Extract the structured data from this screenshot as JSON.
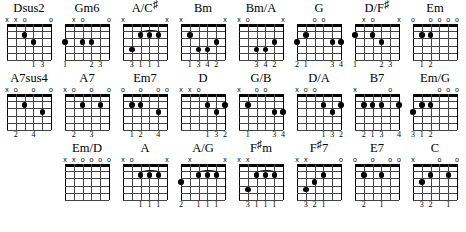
{
  "legend": {
    "open_symbol": "o",
    "muted_symbol": "x"
  },
  "geometry": {
    "strings": 6,
    "frets": 5
  },
  "rows": [
    {
      "chords": [
        {
          "name": "Dsus2",
          "name_base": "Dsus2",
          "sharp": "",
          "markers": [
            "x",
            "x",
            "o",
            "",
            "",
            "o"
          ],
          "dots": [
            {
              "string": 4,
              "fret": 2
            },
            {
              "string": 3,
              "fret": 3
            }
          ],
          "barre": null,
          "fingers": [
            "",
            "",
            "",
            "1",
            "3",
            ""
          ]
        },
        {
          "name": "Gm6",
          "name_base": "Gm6",
          "sharp": "",
          "markers": [
            "",
            "x",
            "o",
            "",
            "",
            "o"
          ],
          "dots": [
            {
              "string": 6,
              "fret": 3
            },
            {
              "string": 4,
              "fret": 3
            },
            {
              "string": 3,
              "fret": 3
            }
          ],
          "barre": null,
          "fingers": [
            "1",
            "",
            "",
            "2",
            "3",
            ""
          ]
        },
        {
          "name": "A/C#",
          "name_base": "A/C",
          "sharp": "♯",
          "markers": [
            "x",
            "",
            "",
            "",
            "",
            "x"
          ],
          "dots": [
            {
              "string": 5,
              "fret": 4
            },
            {
              "string": 4,
              "fret": 2
            },
            {
              "string": 3,
              "fret": 2
            },
            {
              "string": 2,
              "fret": 2
            }
          ],
          "barre": {
            "from": 4,
            "to": 2,
            "fret": 2
          },
          "fingers": [
            "",
            "3",
            "1",
            "1",
            "1",
            ""
          ]
        },
        {
          "name": "Bm",
          "name_base": "Bm",
          "sharp": "",
          "markers": [
            "x",
            "",
            "",
            "",
            "",
            "x"
          ],
          "dots": [
            {
              "string": 5,
              "fret": 2
            },
            {
              "string": 4,
              "fret": 4
            },
            {
              "string": 3,
              "fret": 4
            },
            {
              "string": 2,
              "fret": 3
            }
          ],
          "barre": null,
          "fingers": [
            "",
            "1",
            "3",
            "4",
            "2",
            ""
          ]
        },
        {
          "name": "Bm/A",
          "name_base": "Bm/A",
          "sharp": "",
          "markers": [
            "x",
            "o",
            "",
            "",
            "",
            "x"
          ],
          "dots": [
            {
              "string": 4,
              "fret": 4
            },
            {
              "string": 3,
              "fret": 4
            },
            {
              "string": 2,
              "fret": 3
            }
          ],
          "barre": null,
          "fingers": [
            "",
            "",
            "3",
            "4",
            "2",
            ""
          ]
        },
        {
          "name": "G",
          "name_base": "G",
          "sharp": "",
          "markers": [
            "",
            "",
            "o",
            "o",
            "",
            ""
          ],
          "dots": [
            {
              "string": 6,
              "fret": 3
            },
            {
              "string": 5,
              "fret": 2
            },
            {
              "string": 2,
              "fret": 3
            },
            {
              "string": 1,
              "fret": 3
            }
          ],
          "barre": null,
          "fingers": [
            "2",
            "1",
            "",
            "",
            "3",
            "4"
          ]
        },
        {
          "name": "D/F#",
          "name_base": "D/F",
          "sharp": "♯",
          "markers": [
            "",
            "x",
            "o",
            "",
            "",
            "x"
          ],
          "dots": [
            {
              "string": 6,
              "fret": 2
            },
            {
              "string": 4,
              "fret": 2
            },
            {
              "string": 3,
              "fret": 3
            }
          ],
          "barre": null,
          "fingers": [
            "1",
            "",
            "",
            "2",
            "3",
            ""
          ]
        },
        {
          "name": "Em",
          "name_base": "Em",
          "sharp": "",
          "markers": [
            "o",
            "",
            "o",
            "o",
            "o",
            "o"
          ],
          "dots": [
            {
              "string": 5,
              "fret": 2
            },
            {
              "string": 4,
              "fret": 2
            }
          ],
          "barre": null,
          "fingers": [
            "",
            "1",
            "2",
            "",
            "",
            ""
          ]
        }
      ]
    },
    {
      "chords": [
        {
          "name": "A7sus4",
          "name_base": "A7sus4",
          "sharp": "",
          "markers": [
            "x",
            "o",
            "",
            "o",
            "",
            "o"
          ],
          "dots": [
            {
              "string": 4,
              "fret": 2
            },
            {
              "string": 2,
              "fret": 3
            }
          ],
          "barre": null,
          "fingers": [
            "",
            "2",
            "",
            "4",
            "",
            ""
          ]
        },
        {
          "name": "A7",
          "name_base": "A7",
          "sharp": "",
          "markers": [
            "x",
            "o",
            "",
            "o",
            "",
            "o"
          ],
          "dots": [
            {
              "string": 4,
              "fret": 2
            },
            {
              "string": 2,
              "fret": 2
            }
          ],
          "barre": null,
          "fingers": [
            "",
            "2",
            "",
            "3",
            "",
            ""
          ]
        },
        {
          "name": "Em7",
          "name_base": "Em7",
          "sharp": "",
          "markers": [
            "o",
            "",
            "o",
            "",
            "o",
            "o"
          ],
          "dots": [
            {
              "string": 5,
              "fret": 2
            },
            {
              "string": 4,
              "fret": 2
            },
            {
              "string": 2,
              "fret": 3
            }
          ],
          "barre": null,
          "fingers": [
            "",
            "1",
            "2",
            "",
            "4",
            ""
          ]
        },
        {
          "name": "D",
          "name_base": "D",
          "sharp": "",
          "markers": [
            "x",
            "x",
            "o",
            "",
            "",
            ""
          ],
          "dots": [
            {
              "string": 3,
              "fret": 2
            },
            {
              "string": 1,
              "fret": 2
            },
            {
              "string": 2,
              "fret": 3
            }
          ],
          "barre": null,
          "fingers": [
            "",
            "",
            "",
            "1",
            "3",
            "2"
          ]
        },
        {
          "name": "G/B",
          "name_base": "G/B",
          "sharp": "",
          "markers": [
            "x",
            "",
            "o",
            "o",
            "",
            ""
          ],
          "dots": [
            {
              "string": 5,
              "fret": 2
            },
            {
              "string": 2,
              "fret": 3
            },
            {
              "string": 1,
              "fret": 3
            }
          ],
          "barre": null,
          "fingers": [
            "",
            "1",
            "",
            "",
            "3",
            "4"
          ]
        },
        {
          "name": "D/A",
          "name_base": "D/A",
          "sharp": "",
          "markers": [
            "x",
            "o",
            "o",
            "",
            "",
            ""
          ],
          "dots": [
            {
              "string": 3,
              "fret": 2
            },
            {
              "string": 1,
              "fret": 2
            },
            {
              "string": 2,
              "fret": 3
            }
          ],
          "barre": null,
          "fingers": [
            "",
            "",
            "",
            "1",
            "3",
            "2"
          ]
        },
        {
          "name": "B7",
          "name_base": "B7",
          "sharp": "",
          "markers": [
            "x",
            "",
            "",
            "",
            "o",
            ""
          ],
          "dots": [
            {
              "string": 5,
              "fret": 2
            },
            {
              "string": 4,
              "fret": 2
            },
            {
              "string": 3,
              "fret": 2
            },
            {
              "string": 1,
              "fret": 2
            }
          ],
          "barre": null,
          "fingers": [
            "",
            "2",
            "1",
            "3",
            "",
            "4"
          ]
        },
        {
          "name": "Em/G",
          "name_base": "Em/G",
          "sharp": "",
          "markers": [
            "",
            "",
            "",
            "o",
            "o",
            "o"
          ],
          "dots": [
            {
              "string": 6,
              "fret": 3
            },
            {
              "string": 5,
              "fret": 2
            },
            {
              "string": 4,
              "fret": 2
            }
          ],
          "barre": null,
          "fingers": [
            "3",
            "1",
            "2",
            "",
            "",
            ""
          ]
        }
      ]
    },
    {
      "leading_blanks": 1,
      "chords": [
        {
          "name": "Em/D",
          "name_base": "Em/D",
          "sharp": "",
          "markers": [
            "x",
            "x",
            "o",
            "o",
            "o",
            "o"
          ],
          "dots": [],
          "barre": null,
          "fingers": [
            "",
            "",
            "",
            "",
            "",
            ""
          ]
        },
        {
          "name": "A",
          "name_base": "A",
          "sharp": "",
          "markers": [
            "x",
            "o",
            "",
            "",
            "",
            "x"
          ],
          "dots": [
            {
              "string": 4,
              "fret": 2
            },
            {
              "string": 3,
              "fret": 2
            },
            {
              "string": 2,
              "fret": 2
            }
          ],
          "barre": {
            "from": 4,
            "to": 2,
            "fret": 2
          },
          "fingers": [
            "",
            "",
            "1",
            "1",
            "1",
            ""
          ]
        },
        {
          "name": "A/G",
          "name_base": "A/G",
          "sharp": "",
          "markers": [
            "",
            "x",
            "",
            "",
            "",
            "x"
          ],
          "dots": [
            {
              "string": 6,
              "fret": 3
            },
            {
              "string": 4,
              "fret": 2
            },
            {
              "string": 3,
              "fret": 2
            },
            {
              "string": 2,
              "fret": 2
            }
          ],
          "barre": {
            "from": 4,
            "to": 2,
            "fret": 2
          },
          "fingers": [
            "2",
            "",
            "1",
            "1",
            "1",
            ""
          ]
        },
        {
          "name": "F#m",
          "name_base": "F",
          "sharp": "♯",
          "name_tail": "m",
          "markers": [
            "x",
            "x",
            "",
            "",
            "",
            ""
          ],
          "dots": [
            {
              "string": 4,
              "fret": 2
            },
            {
              "string": 3,
              "fret": 2
            },
            {
              "string": 2,
              "fret": 2
            },
            {
              "string": 5,
              "fret": 4
            }
          ],
          "barre": {
            "from": 4,
            "to": 2,
            "fret": 2
          },
          "fingers": [
            "",
            "3",
            "1",
            "1",
            "1",
            ""
          ]
        },
        {
          "name": "F#7",
          "name_base": "F",
          "sharp": "♯",
          "name_tail": "7",
          "markers": [
            "x",
            "x",
            "",
            "",
            "",
            "o"
          ],
          "dots": [
            {
              "string": 5,
              "fret": 4
            },
            {
              "string": 4,
              "fret": 3
            },
            {
              "string": 3,
              "fret": 2
            }
          ],
          "barre": null,
          "fingers": [
            "",
            "3",
            "2",
            "1",
            "",
            ""
          ]
        },
        {
          "name": "E7",
          "name_base": "E7",
          "sharp": "",
          "markers": [
            "o",
            "",
            "o",
            "",
            "o",
            "o"
          ],
          "dots": [
            {
              "string": 5,
              "fret": 2
            },
            {
              "string": 3,
              "fret": 2
            }
          ],
          "barre": null,
          "fingers": [
            "",
            "2",
            "",
            "1",
            "",
            ""
          ]
        },
        {
          "name": "C",
          "name_base": "C",
          "sharp": "",
          "markers": [
            "x",
            "",
            "",
            "o",
            "",
            "o"
          ],
          "dots": [
            {
              "string": 5,
              "fret": 3
            },
            {
              "string": 4,
              "fret": 2
            },
            {
              "string": 2,
              "fret": 2
            }
          ],
          "barre": null,
          "fingers": [
            "",
            "3",
            "2",
            "",
            "1",
            ""
          ]
        }
      ]
    }
  ]
}
